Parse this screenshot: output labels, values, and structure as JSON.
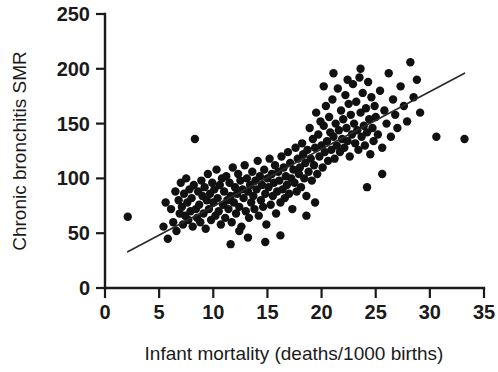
{
  "chart_data": {
    "type": "scatter",
    "title": "",
    "xlabel": "Infant mortality (deaths/1000 births)",
    "ylabel": "Chronic bronchitis SMR",
    "xlim": [
      0,
      35
    ],
    "ylim": [
      0,
      250
    ],
    "xticks": [
      0,
      5,
      10,
      15,
      20,
      25,
      30,
      35
    ],
    "yticks": [
      0,
      50,
      100,
      150,
      200,
      250
    ],
    "xtick_labels": [
      "0",
      "5",
      "10",
      "15",
      "20",
      "25",
      "30",
      "35"
    ],
    "ytick_labels": [
      "0",
      "50",
      "100",
      "150",
      "200",
      "250"
    ],
    "grid": false,
    "legend": null,
    "marker": {
      "shape": "circle",
      "color": "#111111",
      "size": 4.6
    },
    "trendline": {
      "present": true,
      "color": "#2b2b2b",
      "x_start": 2.1,
      "y_start": 33.0,
      "x_end": 33.2,
      "y_end": 196.0,
      "slope": 5.24,
      "intercept": 22.0
    },
    "n_points": 212,
    "points": [
      [
        2.1,
        65
      ],
      [
        5.4,
        56
      ],
      [
        5.6,
        78
      ],
      [
        5.8,
        45
      ],
      [
        6.1,
        72
      ],
      [
        6.3,
        60
      ],
      [
        6.5,
        88
      ],
      [
        6.6,
        52
      ],
      [
        6.8,
        80
      ],
      [
        6.9,
        68
      ],
      [
        7.0,
        96
      ],
      [
        7.1,
        74
      ],
      [
        7.2,
        58
      ],
      [
        7.3,
        86
      ],
      [
        7.4,
        66
      ],
      [
        7.5,
        100
      ],
      [
        7.6,
        78
      ],
      [
        7.7,
        62
      ],
      [
        7.8,
        90
      ],
      [
        7.9,
        70
      ],
      [
        8.0,
        82
      ],
      [
        8.1,
        56
      ],
      [
        8.2,
        94
      ],
      [
        8.3,
        136
      ],
      [
        8.4,
        72
      ],
      [
        8.5,
        64
      ],
      [
        8.6,
        88
      ],
      [
        8.7,
        76
      ],
      [
        8.8,
        60
      ],
      [
        8.9,
        98
      ],
      [
        9.0,
        84
      ],
      [
        9.1,
        68
      ],
      [
        9.2,
        92
      ],
      [
        9.3,
        54
      ],
      [
        9.4,
        80
      ],
      [
        9.5,
        104
      ],
      [
        9.6,
        72
      ],
      [
        9.7,
        86
      ],
      [
        9.8,
        62
      ],
      [
        9.9,
        96
      ],
      [
        10.0,
        78
      ],
      [
        10.1,
        90
      ],
      [
        10.2,
        66
      ],
      [
        10.3,
        108
      ],
      [
        10.4,
        82
      ],
      [
        10.5,
        70
      ],
      [
        10.6,
        94
      ],
      [
        10.7,
        58
      ],
      [
        10.8,
        100
      ],
      [
        10.9,
        76
      ],
      [
        11.0,
        88
      ],
      [
        11.1,
        64
      ],
      [
        11.2,
        102
      ],
      [
        11.3,
        80
      ],
      [
        11.4,
        72
      ],
      [
        11.5,
        96
      ],
      [
        11.6,
        84
      ],
      [
        11.7,
        60
      ],
      [
        11.8,
        110
      ],
      [
        11.9,
        78
      ],
      [
        12.0,
        92
      ],
      [
        12.1,
        68
      ],
      [
        12.2,
        86
      ],
      [
        12.3,
        104
      ],
      [
        12.4,
        74
      ],
      [
        12.5,
        98
      ],
      [
        12.6,
        56
      ],
      [
        12.7,
        90
      ],
      [
        12.8,
        82
      ],
      [
        12.9,
        112
      ],
      [
        13.0,
        70
      ],
      [
        13.1,
        100
      ],
      [
        13.2,
        88
      ],
      [
        13.3,
        64
      ],
      [
        13.4,
        94
      ],
      [
        13.5,
        78
      ],
      [
        13.6,
        106
      ],
      [
        13.7,
        84
      ],
      [
        13.8,
        72
      ],
      [
        13.9,
        98
      ],
      [
        14.0,
        90
      ],
      [
        14.1,
        116
      ],
      [
        14.2,
        66
      ],
      [
        14.3,
        102
      ],
      [
        14.4,
        80
      ],
      [
        14.5,
        94
      ],
      [
        14.6,
        74
      ],
      [
        14.7,
        108
      ],
      [
        14.8,
        86
      ],
      [
        14.9,
        58
      ],
      [
        15.0,
        100
      ],
      [
        15.1,
        92
      ],
      [
        15.2,
        118
      ],
      [
        15.3,
        76
      ],
      [
        15.4,
        104
      ],
      [
        15.5,
        84
      ],
      [
        15.6,
        96
      ],
      [
        15.7,
        112
      ],
      [
        15.8,
        68
      ],
      [
        15.9,
        88
      ],
      [
        16.0,
        106
      ],
      [
        16.1,
        98
      ],
      [
        16.2,
        78
      ],
      [
        16.3,
        120
      ],
      [
        16.4,
        90
      ],
      [
        16.5,
        110
      ],
      [
        16.6,
        82
      ],
      [
        16.7,
        102
      ],
      [
        16.8,
        94
      ],
      [
        16.9,
        124
      ],
      [
        17.0,
        86
      ],
      [
        17.1,
        114
      ],
      [
        17.2,
        100
      ],
      [
        17.3,
        72
      ],
      [
        17.4,
        108
      ],
      [
        17.5,
        96
      ],
      [
        17.6,
        128
      ],
      [
        17.7,
        88
      ],
      [
        17.8,
        118
      ],
      [
        17.9,
        104
      ],
      [
        18.0,
        110
      ],
      [
        18.1,
        92
      ],
      [
        18.2,
        132
      ],
      [
        18.3,
        122
      ],
      [
        18.4,
        100
      ],
      [
        18.5,
        114
      ],
      [
        18.6,
        84
      ],
      [
        18.7,
        126
      ],
      [
        18.8,
        106
      ],
      [
        18.9,
        146
      ],
      [
        19.0,
        118
      ],
      [
        19.1,
        98
      ],
      [
        19.2,
        136
      ],
      [
        19.3,
        112
      ],
      [
        19.4,
        128
      ],
      [
        19.5,
        160
      ],
      [
        19.6,
        104
      ],
      [
        19.7,
        140
      ],
      [
        19.8,
        120
      ],
      [
        19.9,
        152
      ],
      [
        20.0,
        130
      ],
      [
        20.1,
        110
      ],
      [
        20.2,
        148
      ],
      [
        20.3,
        124
      ],
      [
        20.4,
        166
      ],
      [
        20.5,
        134
      ],
      [
        20.6,
        116
      ],
      [
        20.7,
        156
      ],
      [
        20.8,
        142
      ],
      [
        20.9,
        126
      ],
      [
        21.0,
        172
      ],
      [
        21.1,
        138
      ],
      [
        21.2,
        118
      ],
      [
        21.3,
        150
      ],
      [
        21.4,
        130
      ],
      [
        21.5,
        182
      ],
      [
        21.6,
        144
      ],
      [
        21.7,
        124
      ],
      [
        21.8,
        162
      ],
      [
        21.9,
        136
      ],
      [
        22.0,
        154
      ],
      [
        22.1,
        128
      ],
      [
        22.2,
        176
      ],
      [
        22.3,
        146
      ],
      [
        22.4,
        134
      ],
      [
        22.5,
        168
      ],
      [
        22.6,
        120
      ],
      [
        22.7,
        158
      ],
      [
        22.8,
        140
      ],
      [
        22.9,
        186
      ],
      [
        23.0,
        150
      ],
      [
        23.1,
        132
      ],
      [
        23.2,
        170
      ],
      [
        23.3,
        144
      ],
      [
        23.4,
        126
      ],
      [
        23.5,
        192
      ],
      [
        23.6,
        160
      ],
      [
        23.7,
        138
      ],
      [
        23.8,
        178
      ],
      [
        23.9,
        148
      ],
      [
        24.0,
        130
      ],
      [
        24.1,
        164
      ],
      [
        24.2,
        142
      ],
      [
        24.3,
        188
      ],
      [
        24.4,
        154
      ],
      [
        24.5,
        122
      ],
      [
        24.6,
        174
      ],
      [
        24.7,
        146
      ],
      [
        24.8,
        134
      ],
      [
        24.9,
        166
      ],
      [
        25.0,
        156
      ],
      [
        25.2,
        140
      ],
      [
        25.4,
        180
      ],
      [
        25.6,
        128
      ],
      [
        25.8,
        162
      ],
      [
        26.0,
        150
      ],
      [
        26.2,
        196
      ],
      [
        26.4,
        138
      ],
      [
        26.6,
        172
      ],
      [
        26.8,
        158
      ],
      [
        27.0,
        146
      ],
      [
        27.3,
        184
      ],
      [
        27.6,
        166
      ],
      [
        27.9,
        152
      ],
      [
        28.2,
        206
      ],
      [
        28.5,
        174
      ],
      [
        28.8,
        190
      ],
      [
        29.1,
        160
      ],
      [
        22.4,
        190
      ],
      [
        23.6,
        200
      ],
      [
        20.2,
        184
      ],
      [
        21.1,
        196
      ],
      [
        18.6,
        66
      ],
      [
        19.4,
        78
      ],
      [
        16.2,
        48
      ],
      [
        14.8,
        42
      ],
      [
        13.2,
        46
      ],
      [
        11.6,
        40
      ],
      [
        12.4,
        52
      ],
      [
        24.2,
        92
      ],
      [
        25.6,
        104
      ],
      [
        30.6,
        138
      ],
      [
        33.2,
        136
      ]
    ]
  }
}
